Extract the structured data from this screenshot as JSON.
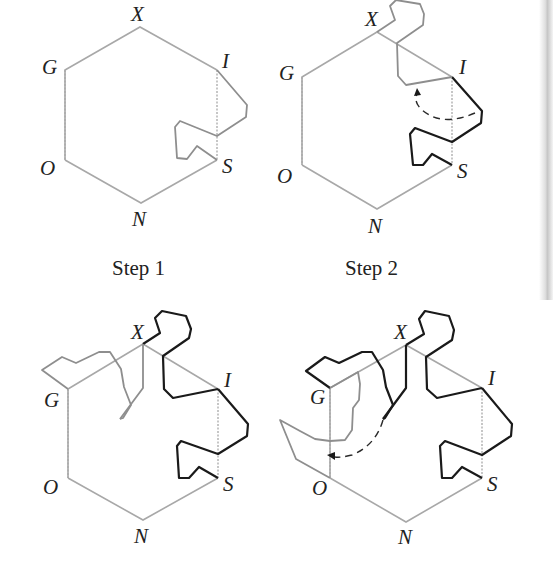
{
  "figure": {
    "captions": {
      "step1": "Step 1",
      "step2": "Step 2"
    },
    "vertex_labels": {
      "X": "X",
      "I": "I",
      "S": "S",
      "N": "N",
      "O": "O",
      "G": "G"
    },
    "panels": [
      {
        "id": "initial",
        "labels": [
          "X",
          "I",
          "S",
          "N",
          "O",
          "G"
        ]
      },
      {
        "id": "step1-start",
        "labels": [
          "X",
          "I",
          "S",
          "N",
          "O",
          "G"
        ]
      },
      {
        "id": "step1-result",
        "caption_key": "step1",
        "labels": [
          "X",
          "I",
          "S",
          "N",
          "O",
          "G"
        ]
      },
      {
        "id": "step2-result",
        "caption_key": "step2",
        "labels": [
          "X",
          "I",
          "S",
          "N",
          "O",
          "G"
        ]
      }
    ],
    "colors": {
      "hexagon": "#a8a8a8",
      "curve_gray": "#8e8e8e",
      "curve_black": "#1a1a1a"
    }
  }
}
